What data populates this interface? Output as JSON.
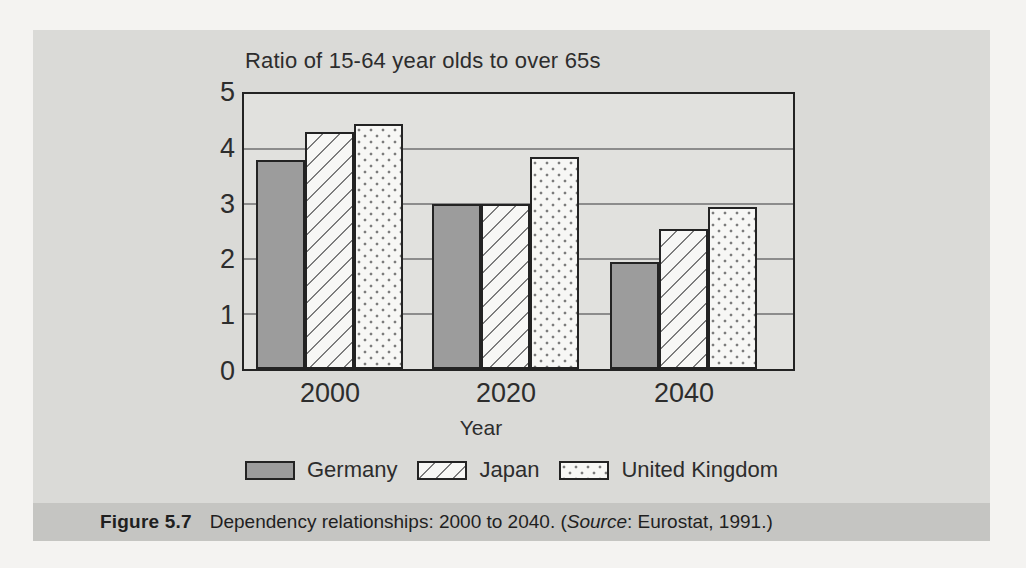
{
  "chart_data": {
    "type": "bar",
    "title": "Ratio of 15-64 year olds to over 65s",
    "categories": [
      "2000",
      "2020",
      "2040"
    ],
    "series": [
      {
        "name": "Germany",
        "pattern": "solid",
        "values": [
          3.8,
          3.0,
          1.95
        ]
      },
      {
        "name": "Japan",
        "pattern": "hatch",
        "values": [
          4.3,
          3.0,
          2.55
        ]
      },
      {
        "name": "United Kingdom",
        "pattern": "dots",
        "values": [
          4.45,
          3.85,
          2.95
        ]
      }
    ],
    "xlabel": "Year",
    "ylabel": "",
    "ylim": [
      0,
      5
    ],
    "yticks": [
      0,
      1,
      2,
      3,
      4,
      5
    ],
    "grid": "horizontal",
    "legend_position": "bottom"
  },
  "caption": {
    "label": "Figure 5.7",
    "body": "Dependency relationships: 2000 to 2040. (",
    "source_word": "Source",
    "tail": ": Eurostat, 1991.)"
  },
  "colors": {
    "page_bg": "#f4f3f1",
    "panel_bg": "#dadad7",
    "caption_band_bg": "#c5c5c2",
    "plot_bg": "#e1e1de",
    "gridline": "#8c8c8c",
    "border": "#232323",
    "bar_germany": "#9c9c9c",
    "bar_light": "#f7f7f5",
    "text": "#2d2d2d"
  }
}
